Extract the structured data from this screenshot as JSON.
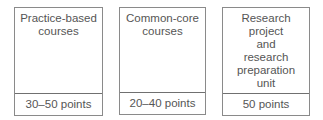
{
  "boxes": [
    {
      "title_lines": [
        "Practice-based",
        "courses"
      ],
      "points": "30–50 points"
    },
    {
      "title_lines": [
        "Common-core",
        "courses"
      ],
      "points": "20–40 points"
    },
    {
      "title_lines": [
        "Research",
        "project",
        "and",
        "research",
        "preparation",
        "unit"
      ],
      "points": "50 points"
    }
  ]
}
